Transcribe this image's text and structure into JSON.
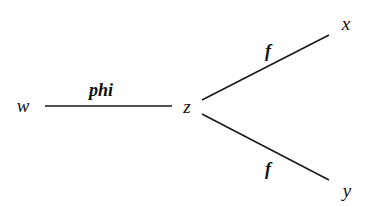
{
  "diagram": {
    "type": "tree",
    "nodes": [
      {
        "id": "w",
        "label": "w"
      },
      {
        "id": "z",
        "label": "z"
      },
      {
        "id": "x",
        "label": "x"
      },
      {
        "id": "y",
        "label": "y"
      }
    ],
    "edges": [
      {
        "from": "w",
        "to": "z",
        "label": "phi"
      },
      {
        "from": "z",
        "to": "x",
        "label": "f"
      },
      {
        "from": "z",
        "to": "y",
        "label": "f"
      }
    ],
    "colors": {
      "line": "#1a1a1a",
      "text": "#111111",
      "background": "#ffffff"
    }
  }
}
